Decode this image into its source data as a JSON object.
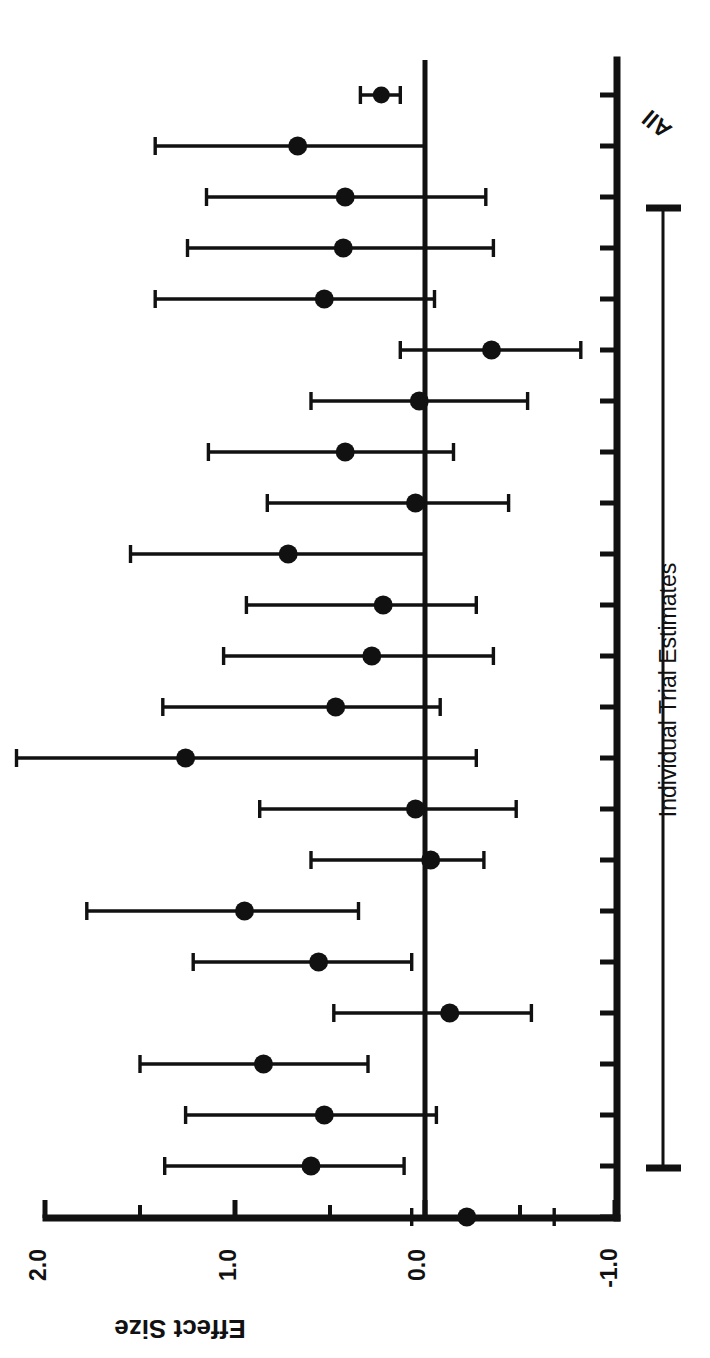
{
  "chart_data": {
    "type": "scatter",
    "subtype": "forest-plot",
    "title": "",
    "orientation": "rotated-90-clockwise",
    "xlabel": "",
    "ylabel": "Effect Size",
    "value_axis": {
      "label": "Effect Size",
      "ticks": [
        2.0,
        1.5,
        1.0,
        0.5,
        0.0,
        -0.5,
        -1.0
      ],
      "tick_labels": [
        "2.0",
        "",
        "1.0",
        "",
        "0.0",
        "",
        "-1.0"
      ],
      "major_tick_labels": [
        "2.0",
        "1.0",
        "0.0",
        "-1.0"
      ],
      "lim": [
        2.0,
        -1.0
      ],
      "reference_line": 0.0
    },
    "category_axis": {
      "group_label": "Individual Trial Estimates",
      "summary_label": "All",
      "n_categories": 22,
      "grid": false
    },
    "legend": null,
    "series": [
      {
        "name": "All",
        "kind": "summary",
        "estimate": 0.23,
        "ci_low": 0.13,
        "ci_high": 0.34
      },
      {
        "name": "Individual Trial Estimates",
        "kind": "trials",
        "points": [
          {
            "estimate": 0.67,
            "ci_low": 0.0,
            "ci_high": 1.42
          },
          {
            "estimate": 0.42,
            "ci_low": -0.32,
            "ci_high": 1.15
          },
          {
            "estimate": 0.43,
            "ci_low": -0.36,
            "ci_high": 1.25
          },
          {
            "estimate": 0.53,
            "ci_low": -0.05,
            "ci_high": 1.42
          },
          {
            "estimate": -0.35,
            "ci_low": -0.82,
            "ci_high": 0.13
          },
          {
            "estimate": 0.03,
            "ci_low": -0.54,
            "ci_high": 0.6
          },
          {
            "estimate": 0.42,
            "ci_low": -0.15,
            "ci_high": 1.14
          },
          {
            "estimate": 0.05,
            "ci_low": -0.44,
            "ci_high": 0.83
          },
          {
            "estimate": 0.72,
            "ci_low": 0.0,
            "ci_high": 1.55
          },
          {
            "estimate": 0.22,
            "ci_low": -0.27,
            "ci_high": 0.94
          },
          {
            "estimate": 0.28,
            "ci_low": -0.36,
            "ci_high": 1.06
          },
          {
            "estimate": 0.47,
            "ci_low": -0.08,
            "ci_high": 1.38
          },
          {
            "estimate": 1.26,
            "ci_low": -0.27,
            "ci_high": 2.15
          },
          {
            "estimate": 0.05,
            "ci_low": -0.48,
            "ci_high": 0.87
          },
          {
            "estimate": -0.03,
            "ci_low": -0.31,
            "ci_high": 0.6
          },
          {
            "estimate": 0.95,
            "ci_low": 0.35,
            "ci_high": 1.78
          },
          {
            "estimate": 0.56,
            "ci_low": 0.07,
            "ci_high": 1.22
          },
          {
            "estimate": -0.13,
            "ci_low": -0.56,
            "ci_high": 0.48
          },
          {
            "estimate": 0.85,
            "ci_low": 0.3,
            "ci_high": 1.5
          },
          {
            "estimate": 0.53,
            "ci_low": -0.06,
            "ci_high": 1.26
          },
          {
            "estimate": 0.6,
            "ci_low": 0.11,
            "ci_high": 1.37
          },
          {
            "estimate": -0.22,
            "ci_low": -0.68,
            "ci_high": 0.07
          }
        ]
      }
    ]
  },
  "labels": {
    "axis_title": "Effect Size",
    "tick_2": "2.0",
    "tick_1": "1.0",
    "tick_0": "0.0",
    "tick_neg1": "-1.0",
    "group_bracket": "Individual Trial Estimates",
    "summary": "All"
  },
  "colors": {
    "ink": "#111111",
    "background": "#ffffff"
  }
}
